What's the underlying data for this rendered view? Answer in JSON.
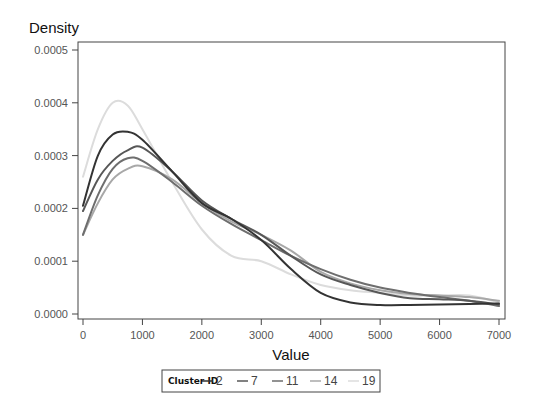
{
  "chart_data": {
    "type": "line",
    "title": "",
    "xlabel": "Value",
    "ylabel": "Density",
    "xlim": [
      0,
      7000
    ],
    "ylim": [
      0,
      0.0005
    ],
    "x_ticks": [
      "0",
      "1000",
      "2000",
      "3000",
      "4000",
      "5000",
      "6000",
      "7000"
    ],
    "y_ticks": [
      "0.0000",
      "0.0001",
      "0.0002",
      "0.0003",
      "0.0004",
      "0.0005"
    ],
    "grid": false,
    "legend": {
      "title": "Cluster ID",
      "position": "bottom",
      "entries": [
        "2",
        "7",
        "11",
        "14",
        "19"
      ]
    },
    "x": [
      0,
      250,
      500,
      750,
      1000,
      1500,
      2000,
      2500,
      3000,
      3500,
      4000,
      4500,
      5000,
      5500,
      6000,
      6500,
      7000
    ],
    "series": [
      {
        "name": "2",
        "color": "#333333",
        "values": [
          0.000205,
          0.0003,
          0.00034,
          0.000345,
          0.00033,
          0.00027,
          0.00021,
          0.00018,
          0.00014,
          8.5e-05,
          4e-05,
          2.2e-05,
          1.7e-05,
          1.7e-05,
          1.8e-05,
          1.9e-05,
          2e-05
        ]
      },
      {
        "name": "7",
        "color": "#575757",
        "values": [
          0.000195,
          0.000255,
          0.00029,
          0.00031,
          0.000315,
          0.00027,
          0.000215,
          0.00018,
          0.00015,
          0.00011,
          7.5e-05,
          5.5e-05,
          4e-05,
          3e-05,
          2.8e-05,
          2.5e-05,
          1.8e-05
        ]
      },
      {
        "name": "11",
        "color": "#6e6e6e",
        "values": [
          0.00015,
          0.000225,
          0.000275,
          0.000295,
          0.00029,
          0.00025,
          0.000205,
          0.00017,
          0.00014,
          0.00011,
          8.5e-05,
          6.5e-05,
          5e-05,
          4e-05,
          3.2e-05,
          2.5e-05,
          1.5e-05
        ]
      },
      {
        "name": "14",
        "color": "#a8a8a8",
        "values": [
          0.00015,
          0.00021,
          0.000255,
          0.000275,
          0.00028,
          0.000255,
          0.00021,
          0.000175,
          0.00015,
          0.00012,
          8e-05,
          5.8e-05,
          4.5e-05,
          3.8e-05,
          3.5e-05,
          3.2e-05,
          2.5e-05
        ]
      },
      {
        "name": "19",
        "color": "#dcdcdc",
        "values": [
          0.00026,
          0.00035,
          0.0004,
          0.000395,
          0.00035,
          0.00025,
          0.00016,
          0.00011,
          0.0001,
          7.5e-05,
          5.5e-05,
          4.5e-05,
          4e-05,
          3.5e-05,
          3.5e-05,
          3.5e-05,
          2.2e-05
        ]
      }
    ]
  }
}
